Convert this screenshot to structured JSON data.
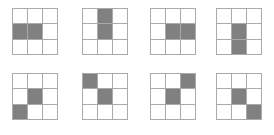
{
  "figure": {
    "title": "",
    "colors": {
      "background": "#ffffff",
      "shaded_cell": "#808080",
      "empty_cell": "#ffffff",
      "grid_line": "#aaaaaa"
    },
    "layout": {
      "rows": 2,
      "columns": 4,
      "panel_count": 8,
      "grid_rows": 3,
      "grid_columns": 3,
      "panel_width_px": 46,
      "panel_height_px": 47
    },
    "panels": [
      {
        "index": 1,
        "label": "",
        "left_px": 12,
        "top_px": 8,
        "shaded_indices": [
          3,
          4
        ],
        "shaded_positions": [
          "middle-left",
          "center"
        ],
        "orientation": "horizontal-left",
        "cells": [
          0,
          0,
          0,
          1,
          1,
          0,
          0,
          0,
          0
        ]
      },
      {
        "index": 2,
        "label": "",
        "left_px": 82,
        "top_px": 8,
        "shaded_indices": [
          1,
          4
        ],
        "shaded_positions": [
          "top-center",
          "center"
        ],
        "orientation": "vertical-up",
        "cells": [
          0,
          1,
          0,
          0,
          1,
          0,
          0,
          0,
          0
        ]
      },
      {
        "index": 3,
        "label": "",
        "left_px": 150,
        "top_px": 8,
        "shaded_indices": [
          4,
          5
        ],
        "shaded_positions": [
          "center",
          "middle-right"
        ],
        "orientation": "horizontal-right",
        "cells": [
          0,
          0,
          0,
          0,
          1,
          1,
          0,
          0,
          0
        ]
      },
      {
        "index": 4,
        "label": "",
        "left_px": 216,
        "top_px": 8,
        "shaded_indices": [
          4,
          7
        ],
        "shaded_positions": [
          "center",
          "bottom-center"
        ],
        "orientation": "vertical-down",
        "cells": [
          0,
          0,
          0,
          0,
          1,
          0,
          0,
          1,
          0
        ]
      },
      {
        "index": 5,
        "label": "",
        "left_px": 12,
        "top_px": 73,
        "shaded_indices": [
          4,
          6
        ],
        "shaded_positions": [
          "center",
          "bottom-left"
        ],
        "orientation": "diagonal-down-left",
        "cells": [
          0,
          0,
          0,
          0,
          1,
          0,
          1,
          0,
          0
        ]
      },
      {
        "index": 6,
        "label": "",
        "left_px": 82,
        "top_px": 73,
        "shaded_indices": [
          0,
          4
        ],
        "shaded_positions": [
          "top-left",
          "center"
        ],
        "orientation": "diagonal-up-left",
        "cells": [
          1,
          0,
          0,
          0,
          1,
          0,
          0,
          0,
          0
        ]
      },
      {
        "index": 7,
        "label": "",
        "left_px": 150,
        "top_px": 73,
        "shaded_indices": [
          2,
          4
        ],
        "shaded_positions": [
          "top-right",
          "center"
        ],
        "orientation": "diagonal-up-right",
        "cells": [
          0,
          0,
          1,
          0,
          1,
          0,
          0,
          0,
          0
        ]
      },
      {
        "index": 8,
        "label": "",
        "left_px": 216,
        "top_px": 73,
        "shaded_indices": [
          4,
          8
        ],
        "shaded_positions": [
          "center",
          "bottom-right"
        ],
        "orientation": "diagonal-down-right",
        "cells": [
          0,
          0,
          0,
          0,
          1,
          0,
          0,
          0,
          1
        ]
      }
    ]
  }
}
